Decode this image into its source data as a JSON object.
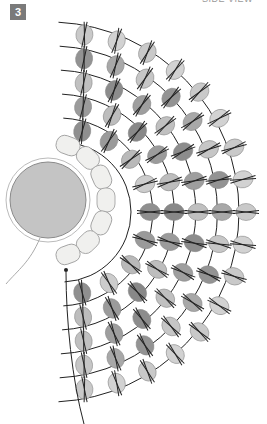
{
  "figure": {
    "step_number": "3",
    "caption_cut": "SIDE VIEW"
  },
  "geometry": {
    "center": [
      68,
      212
    ],
    "disc": {
      "cx": 48,
      "cy": 200,
      "r": 38,
      "fill": "#c4c4c4"
    },
    "inner_ring": {
      "r": 58,
      "count": 7,
      "fill": "#f0f0ee"
    },
    "rings": [
      {
        "r": 82,
        "count": 9,
        "shades": [
          "#8f8f8f",
          "#9a9a9a",
          "#b9b9b9",
          "#cccccc"
        ]
      },
      {
        "r": 106,
        "count": 11,
        "shades": [
          "#888888",
          "#9b9b9b",
          "#bdbdbd"
        ]
      },
      {
        "r": 130,
        "count": 13,
        "shades": [
          "#8c8c8c",
          "#9e9e9e",
          "#c0c0c0"
        ]
      },
      {
        "r": 154,
        "count": 15,
        "shades": [
          "#939393",
          "#a8a8a8",
          "#c6c6c6"
        ]
      },
      {
        "r": 178,
        "count": 17,
        "shades": [
          "#c9c9c9",
          "#d2d2d2"
        ]
      }
    ]
  },
  "colors": {
    "badge": "#7a7a7a",
    "thread": "#222222",
    "bead_outline": "#8a8a8a",
    "light_bead": "#cfcfcf"
  }
}
